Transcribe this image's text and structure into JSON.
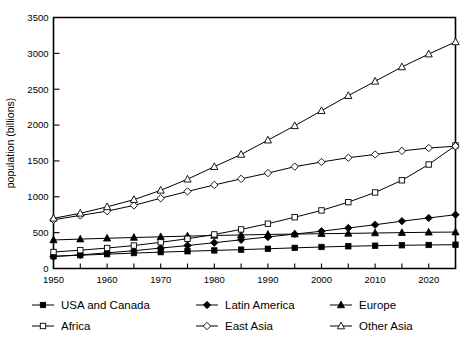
{
  "chart_data": {
    "type": "line",
    "title": "",
    "xlabel": "",
    "ylabel": "population (billions)",
    "xlim": [
      1950,
      2025
    ],
    "ylim": [
      0,
      3500
    ],
    "grid": false,
    "legend_position": "bottom",
    "x": [
      1950,
      1955,
      1960,
      1965,
      1970,
      1975,
      1980,
      1985,
      1990,
      1995,
      2000,
      2005,
      2010,
      2015,
      2020,
      2025
    ],
    "y_ticks": [
      0,
      500,
      1000,
      1500,
      2000,
      2500,
      3000,
      3500
    ],
    "x_ticks": [
      1950,
      1955,
      1960,
      1965,
      1970,
      1975,
      1980,
      1985,
      1990,
      1995,
      2000,
      2005,
      2010,
      2015,
      2020,
      2025
    ],
    "x_tick_labels": [
      "1950",
      "",
      "1960",
      "",
      "1970",
      "",
      "1980",
      "",
      "1990",
      "",
      "2000",
      "",
      "2010",
      "",
      "2020",
      ""
    ],
    "series": [
      {
        "name": "USA and Canada",
        "marker": "filled-square",
        "values": [
          170,
          185,
          200,
          215,
          228,
          240,
          252,
          263,
          275,
          288,
          300,
          310,
          318,
          324,
          328,
          332
        ]
      },
      {
        "name": "Latin America",
        "marker": "filled-diamond",
        "values": [
          168,
          190,
          218,
          248,
          285,
          320,
          360,
          400,
          440,
          480,
          520,
          565,
          610,
          660,
          705,
          750
        ]
      },
      {
        "name": "Europe",
        "marker": "filled-triangle",
        "values": [
          398,
          410,
          422,
          432,
          442,
          452,
          460,
          468,
          475,
          480,
          485,
          490,
          495,
          500,
          505,
          508
        ]
      },
      {
        "name": "Africa",
        "marker": "open-square",
        "values": [
          230,
          255,
          285,
          320,
          365,
          415,
          475,
          545,
          625,
          715,
          810,
          925,
          1060,
          1230,
          1450,
          1715
        ]
      },
      {
        "name": "East Asia",
        "marker": "open-diamond",
        "values": [
          680,
          740,
          800,
          880,
          980,
          1075,
          1165,
          1250,
          1330,
          1420,
          1485,
          1545,
          1590,
          1640,
          1680,
          1705
        ]
      },
      {
        "name": "Other Asia",
        "marker": "open-triangle",
        "values": [
          700,
          770,
          860,
          960,
          1090,
          1245,
          1420,
          1590,
          1790,
          1990,
          2200,
          2410,
          2610,
          2810,
          2990,
          3160
        ]
      }
    ]
  },
  "axis": {
    "y_title": "population (billions)",
    "y_tick_labels": [
      "0",
      "500",
      "1000",
      "1500",
      "2000",
      "2500",
      "3000",
      "3500"
    ]
  },
  "legend": {
    "row1": [
      {
        "label": "USA and Canada",
        "marker": "filled-square"
      },
      {
        "label": "Latin America",
        "marker": "filled-diamond"
      },
      {
        "label": "Europe",
        "marker": "filled-triangle"
      }
    ],
    "row2": [
      {
        "label": "Africa",
        "marker": "open-square"
      },
      {
        "label": "East Asia",
        "marker": "open-diamond"
      },
      {
        "label": "Other Asia",
        "marker": "open-triangle"
      }
    ]
  },
  "colors": {
    "ink": "#000000",
    "background": "#ffffff"
  }
}
